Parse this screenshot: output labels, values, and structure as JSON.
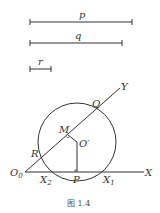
{
  "segments": [
    {
      "label": "p",
      "x1": 30,
      "x2": 132,
      "y": 22
    },
    {
      "label": "q",
      "x1": 30,
      "x2": 122,
      "y": 43
    },
    {
      "label": "r",
      "x1": 30,
      "x2": 51,
      "y": 69
    }
  ],
  "points": {
    "O0": "O",
    "O0_sub": "0",
    "X": "X",
    "Y": "Y",
    "Q": "Q",
    "M": "M",
    "O_prime": "O′",
    "R": "R",
    "P": "P",
    "X1": "X",
    "X1_sub": "1",
    "X2": "X",
    "X2_sub": "2"
  },
  "caption": "图 1.4",
  "colors": {
    "stroke": "#333333",
    "text": "#333333"
  }
}
